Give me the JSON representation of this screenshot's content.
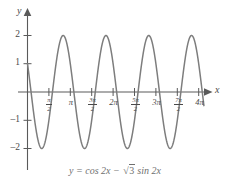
{
  "figure": {
    "caption": "y = cos 2x − √3 sin 2x",
    "caption_parts": {
      "lead": "y = cos 2x − ",
      "radicand": "3",
      "trail": " sin 2x"
    },
    "axis_labels": {
      "x": "x",
      "y": "y"
    },
    "colors": {
      "curve": "#7d7d7d",
      "axis": "#5a5a5a",
      "text": "#4a4a4a",
      "caption": "#6f6f6f",
      "background": "#ffffff"
    },
    "y_ticks": [
      {
        "label": "2",
        "value": 2
      },
      {
        "label": "1",
        "value": 1
      },
      {
        "label": "–1",
        "value": -1
      },
      {
        "label": "–2",
        "value": -2
      }
    ],
    "x_ticks": [
      {
        "label": "π/2",
        "num": "π",
        "den": "2",
        "coef": "",
        "value": 1.5707963
      },
      {
        "label": "π",
        "num": "",
        "den": "",
        "coef": "π",
        "value": 3.1415927
      },
      {
        "label": "3π/2",
        "num": "3π",
        "den": "2",
        "coef": "",
        "value": 4.712389
      },
      {
        "label": "2π",
        "num": "",
        "den": "",
        "coef": "2π",
        "value": 6.2831853
      },
      {
        "label": "5π/2",
        "num": "5π",
        "den": "2",
        "coef": "",
        "value": 7.8539816
      },
      {
        "label": "3π",
        "num": "",
        "den": "",
        "coef": "3π",
        "value": 9.424778
      },
      {
        "label": "7π/2",
        "num": "7π",
        "den": "2",
        "coef": "",
        "value": 10.9955743
      },
      {
        "label": "4π",
        "num": "",
        "den": "",
        "coef": "4π",
        "value": 12.5663706
      }
    ]
  },
  "chart_data": {
    "type": "line",
    "title": "",
    "expression": "y = cos 2x - sqrt(3) sin 2x",
    "equivalent_form": "y = 2 cos(2x + pi/3)",
    "amplitude": 2,
    "period": 3.1415927,
    "phase_shift": -0.5235988,
    "xlabel": "x",
    "ylabel": "y",
    "xlim": [
      -0.35,
      13.3
    ],
    "ylim": [
      -2.55,
      2.45
    ],
    "grid": false,
    "legend": null,
    "x_tick_labels": [
      "π/2",
      "π",
      "3π/2",
      "2π",
      "5π/2",
      "3π",
      "7π/2",
      "4π"
    ],
    "x_tick_values": [
      1.5707963,
      3.1415927,
      4.712389,
      6.2831853,
      7.8539816,
      9.424778,
      10.9955743,
      12.5663706
    ],
    "y_tick_labels": [
      "2",
      "1",
      "–1",
      "–2"
    ],
    "y_tick_values": [
      2,
      1,
      -1,
      -2
    ],
    "series": [
      {
        "name": "y = cos 2x − √3 sin 2x",
        "color": "#7d7d7d",
        "x_start": 0,
        "x_end": 12.95,
        "key_points": [
          {
            "x": 0.0,
            "y": 1.0,
            "note": "y-intercept"
          },
          {
            "x": 0.2618,
            "y": 0.0,
            "note": "zero"
          },
          {
            "x": 1.0472,
            "y": -2.0,
            "note": "minimum"
          },
          {
            "x": 1.8326,
            "y": 0.0,
            "note": "zero"
          },
          {
            "x": 2.618,
            "y": 2.0,
            "note": "maximum"
          },
          {
            "x": 3.4034,
            "y": 0.0,
            "note": "zero"
          },
          {
            "x": 4.1888,
            "y": -2.0,
            "note": "minimum"
          },
          {
            "x": 4.9742,
            "y": 0.0,
            "note": "zero"
          },
          {
            "x": 5.7596,
            "y": 2.0,
            "note": "maximum"
          },
          {
            "x": 6.545,
            "y": 0.0,
            "note": "zero"
          },
          {
            "x": 7.3304,
            "y": -2.0,
            "note": "minimum"
          },
          {
            "x": 8.1158,
            "y": 0.0,
            "note": "zero"
          },
          {
            "x": 8.9012,
            "y": 2.0,
            "note": "maximum"
          },
          {
            "x": 9.6866,
            "y": 0.0,
            "note": "zero"
          },
          {
            "x": 10.472,
            "y": -2.0,
            "note": "minimum"
          },
          {
            "x": 11.2574,
            "y": 0.0,
            "note": "zero"
          },
          {
            "x": 12.0428,
            "y": 2.0,
            "note": "maximum"
          },
          {
            "x": 12.95,
            "y": 1.0,
            "note": "curve end"
          }
        ]
      }
    ]
  }
}
